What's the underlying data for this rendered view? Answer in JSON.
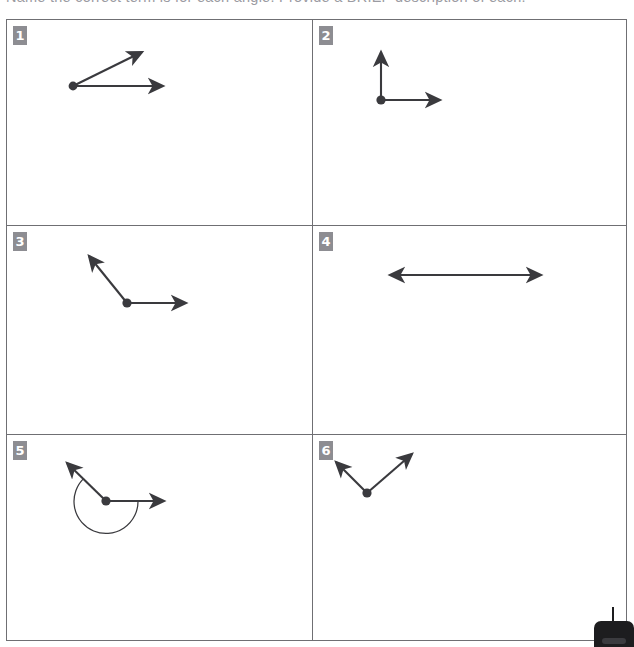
{
  "instruction": {
    "text": "Name the correct term is for each angle. Provide a BRIEF description of each."
  },
  "grid": {
    "columns": 2,
    "rows": 3,
    "border_color": "#6f6f73",
    "badge_color": "#8d8d92",
    "stroke_color": "#3a3a3e"
  },
  "cells": [
    {
      "number": "1",
      "angle_name": "acute-angle",
      "angle_degrees": 35,
      "description": "Acute angle: vertex at lower left with one horizontal ray pointing right and one ray rising to the upper right.",
      "vertex": {
        "x": 66,
        "y": 66
      },
      "rays": [
        {
          "name": "ray-horizontal-right",
          "x": 162,
          "y": 66
        },
        {
          "name": "ray-up-right",
          "x": 139,
          "y": 28
        }
      ],
      "arc": null
    },
    {
      "number": "2",
      "angle_name": "right-angle",
      "angle_degrees": 90,
      "description": "Right angle: vertex with one ray pointing straight up and one ray pointing right.",
      "vertex": {
        "x": 68,
        "y": 80
      },
      "rays": [
        {
          "name": "ray-horizontal-right",
          "x": 133,
          "y": 80
        },
        {
          "name": "ray-vertical-up",
          "x": 68,
          "y": 26
        }
      ],
      "arc": null
    },
    {
      "number": "3",
      "angle_name": "obtuse-angle",
      "angle_degrees": 135,
      "description": "Obtuse angle: vertex with one horizontal ray pointing right and one ray rising to the upper left.",
      "vertex": {
        "x": 120,
        "y": 77
      },
      "rays": [
        {
          "name": "ray-horizontal-right",
          "x": 185,
          "y": 77
        },
        {
          "name": "ray-up-left",
          "x": 77,
          "y": 24
        }
      ],
      "arc": null
    },
    {
      "number": "4",
      "angle_name": "straight-angle",
      "angle_degrees": 180,
      "description": "Straight angle: a single straight line with arrowheads at both ends forming 180 degrees.",
      "vertex": {
        "x": 162,
        "y": 49
      },
      "rays": [
        {
          "name": "ray-left",
          "x": 77,
          "y": 49
        },
        {
          "name": "ray-right",
          "x": 235,
          "y": 49
        }
      ],
      "arc": null
    },
    {
      "number": "5",
      "angle_name": "reflex-angle",
      "angle_degrees": 225,
      "description": "Reflex angle: vertex with one horizontal ray pointing right and one ray to the upper left, with the arc drawn around the outside.",
      "vertex": {
        "x": 99,
        "y": 66
      },
      "rays": [
        {
          "name": "ray-horizontal-right",
          "x": 163,
          "y": 66
        },
        {
          "name": "ray-up-left",
          "x": 55,
          "y": 23
        }
      ],
      "arc": {
        "name": "reflex-arc",
        "radius": 32
      }
    },
    {
      "number": "6",
      "angle_name": "acute-angle",
      "angle_degrees": 80,
      "description": "Acute angle opening upward: vertex at the bottom with one ray to the upper left and one ray to the upper right.",
      "vertex": {
        "x": 54,
        "y": 58
      },
      "rays": [
        {
          "name": "ray-up-left",
          "x": 18,
          "y": 22
        },
        {
          "name": "ray-up-right",
          "x": 104,
          "y": 14
        }
      ],
      "arc": null
    }
  ],
  "artifact": {
    "name": "scanner-edge-artifact"
  }
}
